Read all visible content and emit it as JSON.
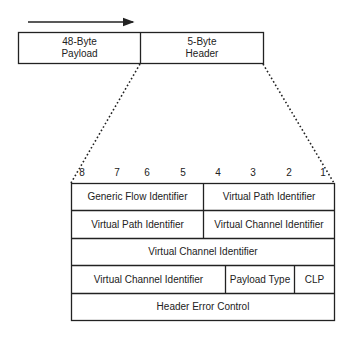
{
  "cell": {
    "payload_label": "48-Byte\nPayload",
    "header_label": "5-Byte\nHeader",
    "payload_line1": "48-Byte",
    "payload_line2": "Payload",
    "header_line1": "5-Byte",
    "header_line2": "Header"
  },
  "bit_positions": [
    "8",
    "7",
    "6",
    "5",
    "4",
    "3",
    "2",
    "1"
  ],
  "header_fields": {
    "row1": [
      "Generic Flow Identifier",
      "Virtual Path Identifier"
    ],
    "row2": [
      "Virtual Path Identifier",
      "Virtual Channel Identifier"
    ],
    "row3": [
      "Virtual Channel Identifier"
    ],
    "row4": [
      "Virtual Channel Identifier",
      "Payload Type",
      "CLP"
    ],
    "row5": [
      "Header Error Control"
    ]
  },
  "colors": {
    "line": "#222222",
    "background": "#ffffff"
  }
}
